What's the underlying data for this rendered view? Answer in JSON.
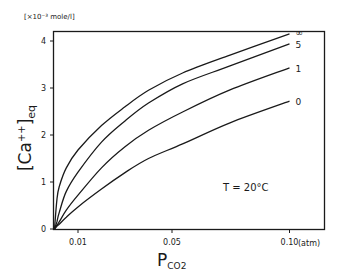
{
  "chart_data": {
    "type": "line",
    "title": "",
    "xlabel": "P_CO2",
    "xlabel_main": "P",
    "xlabel_sub": "CO2",
    "x_unit": "(atm)",
    "ylabel": "[Ca++]eq",
    "ylabel_main": "[Ca",
    "ylabel_sup": "++",
    "ylabel_close": "]",
    "ylabel_sub": "eq",
    "y_unit": "[×10⁻³ mole/l]",
    "xlim": [
      0,
      0.1155
    ],
    "ylim": [
      0,
      4.2
    ],
    "x_ticks": [
      {
        "value": 0.01,
        "label": "0.01"
      },
      {
        "value": 0.05,
        "label": "0.05"
      },
      {
        "value": 0.1,
        "label": "0.10"
      }
    ],
    "y_ticks": [
      {
        "value": 0,
        "label": "0"
      },
      {
        "value": 1,
        "label": "1"
      },
      {
        "value": 2,
        "label": "2"
      },
      {
        "value": 3,
        "label": "3"
      },
      {
        "value": 4,
        "label": "4"
      }
    ],
    "grid": false,
    "annotation": "T  =  20°C",
    "series": [
      {
        "name": "∞",
        "x": [
          0,
          0.001,
          0.002,
          0.005,
          0.01,
          0.02,
          0.03,
          0.04,
          0.0545,
          0.0747,
          0.1
        ],
        "values": [
          0,
          0.62,
          0.9,
          1.3,
          1.68,
          2.2,
          2.6,
          2.95,
          3.32,
          3.7,
          4.15
        ]
      },
      {
        "name": "5",
        "x": [
          0,
          0.001,
          0.002,
          0.005,
          0.01,
          0.02,
          0.03,
          0.04,
          0.0545,
          0.0747,
          0.1
        ],
        "values": [
          0,
          0.15,
          0.35,
          0.8,
          1.21,
          1.85,
          2.3,
          2.68,
          3.09,
          3.47,
          3.94
        ]
      },
      {
        "name": "1",
        "x": [
          0,
          0.001,
          0.002,
          0.005,
          0.01,
          0.02,
          0.03,
          0.04,
          0.0545,
          0.0747,
          0.1
        ],
        "values": [
          0,
          0.08,
          0.15,
          0.4,
          0.72,
          1.3,
          1.75,
          2.1,
          2.49,
          2.96,
          3.43
        ]
      },
      {
        "name": "0",
        "x": [
          0,
          0.001,
          0.002,
          0.005,
          0.01,
          0.02,
          0.03,
          0.04,
          0.0545,
          0.0747,
          0.1
        ],
        "values": [
          0,
          0.06,
          0.1,
          0.25,
          0.47,
          0.85,
          1.2,
          1.5,
          1.81,
          2.26,
          2.72
        ]
      }
    ],
    "legend_position": "inline-right"
  }
}
